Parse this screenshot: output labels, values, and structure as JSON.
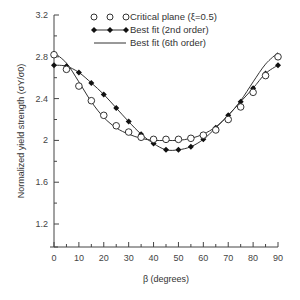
{
  "chart_data": {
    "type": "line",
    "title": "",
    "xlabel": "β (degrees)",
    "ylabel": "Normalized yield strength (σY/σ0)",
    "xlim": [
      0,
      90
    ],
    "ylim": [
      0.98,
      3.2
    ],
    "xticks": [
      0,
      10,
      20,
      30,
      40,
      50,
      60,
      70,
      80,
      90
    ],
    "yticks": [
      1.2,
      1.6,
      2,
      2.4,
      2.8,
      3.2
    ],
    "ytick_labels": [
      "1.2",
      "1.6",
      "2",
      "2.4",
      "2.8",
      "3.2"
    ],
    "grid": false,
    "legend_position": "top-center",
    "x": [
      0,
      5,
      10,
      15,
      20,
      25,
      30,
      35,
      40,
      45,
      50,
      55,
      60,
      65,
      70,
      75,
      80,
      85,
      90
    ],
    "series": [
      {
        "name": "Critical plane (ξ=0.5)",
        "style": "open-circle-markers",
        "values": [
          2.82,
          2.68,
          2.52,
          2.38,
          2.24,
          2.14,
          2.08,
          2.03,
          2.01,
          2.01,
          2.01,
          2.02,
          2.05,
          2.1,
          2.2,
          2.32,
          2.46,
          2.62,
          2.8
        ]
      },
      {
        "name": "Best fit (2nd order)",
        "style": "line-filled-diamond",
        "values": [
          2.72,
          2.71,
          2.65,
          2.55,
          2.44,
          2.31,
          2.18,
          2.06,
          1.97,
          1.91,
          1.91,
          1.94,
          2.01,
          2.12,
          2.24,
          2.37,
          2.5,
          2.64,
          2.72
        ]
      },
      {
        "name": "Best fit (6th order)",
        "style": "solid-line",
        "values": [
          2.84,
          2.74,
          2.56,
          2.37,
          2.22,
          2.12,
          2.06,
          2.02,
          2.0,
          2.0,
          2.0,
          2.02,
          2.06,
          2.13,
          2.24,
          2.38,
          2.56,
          2.73,
          2.84
        ]
      }
    ]
  },
  "legend": {
    "items": [
      "Critical plane (ξ=0.5)",
      "Best fit (2nd order)",
      "Best fit (6th order)"
    ]
  },
  "axes": {
    "xlabel": "β (degrees)",
    "ylabel": "Normalized yield strength (σY/σ0)"
  }
}
